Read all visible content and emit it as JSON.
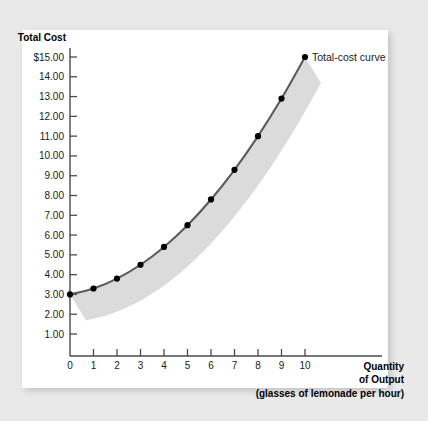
{
  "chart_data": {
    "type": "line",
    "title": "",
    "xlabel": "Quantity of Output (glasses of lemonade per hour)",
    "ylabel": "Total Cost",
    "xlim": [
      0,
      10
    ],
    "ylim": [
      0,
      15
    ],
    "grid": false,
    "legend_position": "inline-right-of-last-point",
    "x": [
      0,
      1,
      2,
      3,
      4,
      5,
      6,
      7,
      8,
      9,
      10
    ],
    "series": [
      {
        "name": "Total-cost curve",
        "values": [
          3.0,
          3.3,
          3.8,
          4.5,
          5.4,
          6.5,
          7.8,
          9.3,
          11.0,
          12.9,
          15.0
        ]
      }
    ],
    "x_tick_labels": [
      "0",
      "1",
      "2",
      "3",
      "4",
      "5",
      "6",
      "7",
      "8",
      "9",
      "10"
    ],
    "y_tick_labels": [
      "1.00",
      "2.00",
      "3.00",
      "4.00",
      "5.00",
      "6.00",
      "7.00",
      "8.00",
      "9.00",
      "10.00",
      "11.00",
      "12.00",
      "13.00",
      "14.00",
      "$15.00"
    ],
    "y_tick_values": [
      1,
      2,
      3,
      4,
      5,
      6,
      7,
      8,
      9,
      10,
      11,
      12,
      13,
      14,
      15
    ],
    "annotations": [
      {
        "text": "Total-cost curve",
        "at_x": 10,
        "at_y": 15
      }
    ],
    "colors": {
      "curve": "#5b5b5b",
      "marker": "#000000",
      "shadow_band": "#d9d9d9",
      "axis": "#4a4a4a",
      "panel": "#ffffff",
      "background": "#e9e9e9"
    }
  },
  "axes": {
    "y_axis_title": "Total Cost",
    "x_axis_title_line1": "Quantity",
    "x_axis_title_line2": "of Output",
    "x_axis_title_line3": "(glasses of lemonade per hour)"
  },
  "legend": {
    "curve_label": "Total-cost curve"
  }
}
